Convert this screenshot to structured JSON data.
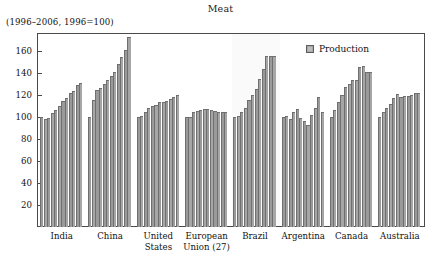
{
  "chart_data": {
    "type": "bar",
    "title": "Meat",
    "subtitle": "(1996–2006, 1996=100)",
    "xlabel": "",
    "ylabel": "",
    "ylim": [
      0,
      176
    ],
    "yticks": [
      20,
      40,
      60,
      80,
      100,
      120,
      140,
      160
    ],
    "grid": false,
    "legend_position": "top-right",
    "legend": [
      "Production"
    ],
    "categories": [
      "India",
      "China",
      "United States",
      "European Union (27)",
      "Brazil",
      "Argentina",
      "Canada",
      "Australia"
    ],
    "category_label_lines": [
      [
        "India"
      ],
      [
        "China"
      ],
      [
        "United",
        "States"
      ],
      [
        "European",
        "Union (27)"
      ],
      [
        "Brazil"
      ],
      [
        "Argentina"
      ],
      [
        "Canada"
      ],
      [
        "Australia"
      ]
    ],
    "x": [
      1996,
      1997,
      1998,
      1999,
      2000,
      2001,
      2002,
      2003,
      2004,
      2005,
      2006
    ],
    "series": [
      {
        "name": "Production",
        "color": "#a0a0a0",
        "groups": [
          {
            "category": "India",
            "values": [
              100,
              98,
              99,
              103,
              106,
              110,
              114,
              117,
              122,
              123,
              129,
              131
            ]
          },
          {
            "category": "China",
            "values": [
              100,
              115,
              124,
              126,
              130,
              133,
              137,
              141,
              148,
              154,
              161,
              172
            ]
          },
          {
            "category": "United States",
            "values": [
              100,
              101,
              104,
              108,
              110,
              111,
              113,
              113,
              114,
              116,
              118,
              120
            ]
          },
          {
            "category": "European Union (27)",
            "values": [
              100,
              100,
              104,
              105,
              106,
              107,
              107,
              106,
              105,
              104,
              104,
              104
            ]
          },
          {
            "category": "Brazil",
            "values": [
              100,
              101,
              104,
              108,
              115,
              120,
              125,
              134,
              143,
              155,
              155,
              155
            ]
          },
          {
            "category": "Argentina",
            "values": [
              100,
              101,
              98,
              104,
              107,
              99,
              96,
              93,
              102,
              108,
              118,
              104
            ]
          },
          {
            "category": "Canada",
            "values": [
              100,
              106,
              113,
              120,
              127,
              130,
              133,
              133,
              145,
              146,
              141,
              141
            ]
          },
          {
            "category": "Australia",
            "values": [
              100,
              104,
              108,
              112,
              117,
              121,
              118,
              119,
              119,
              120,
              122,
              122
            ]
          }
        ]
      }
    ]
  },
  "legend": {
    "items": [
      {
        "label": "Production",
        "swatch_color": "#a8a8a8"
      }
    ]
  },
  "axis": {
    "y_tick_labels": [
      "160",
      "140",
      "120",
      "100",
      "80",
      "60",
      "40",
      "20"
    ]
  }
}
